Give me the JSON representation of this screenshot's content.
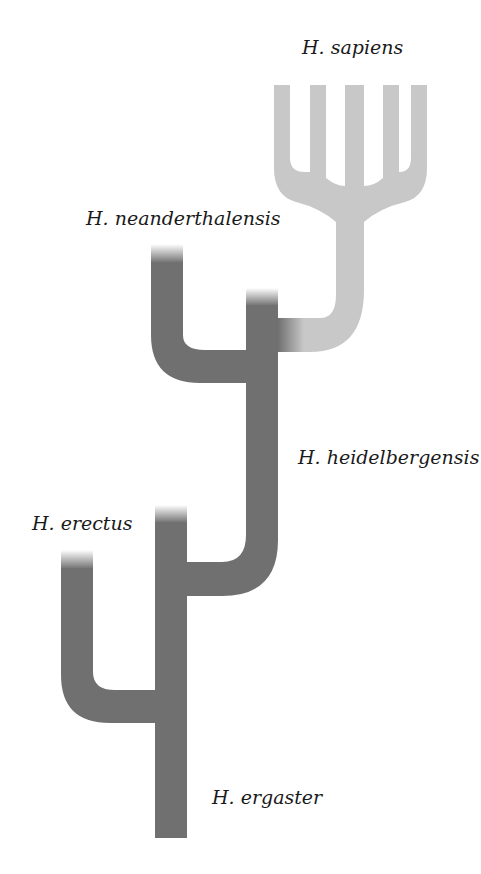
{
  "diagram": {
    "type": "phylogenetic-tree",
    "colors": {
      "dark_branch": "#707070",
      "light_branch": "#c8c8c8",
      "background": "#ffffff",
      "label_text": "#1a1a1a"
    },
    "labels": {
      "sapiens": "H. sapiens",
      "neanderthalensis": "H. neanderthalensis",
      "heidelbergensis": "H. heidelbergensis",
      "erectus": "H. erectus",
      "ergaster": "H. ergaster"
    },
    "nodes": [
      {
        "id": "ergaster",
        "label": "H. ergaster",
        "shade": "dark"
      },
      {
        "id": "erectus",
        "label": "H. erectus",
        "shade": "dark",
        "parent": "ergaster"
      },
      {
        "id": "heidelbergensis",
        "label": "H. heidelbergensis",
        "shade": "dark",
        "parent": "ergaster"
      },
      {
        "id": "neanderthalensis",
        "label": "H. neanderthalensis",
        "shade": "dark",
        "parent": "heidelbergensis"
      },
      {
        "id": "sapiens",
        "label": "H. sapiens",
        "shade": "light",
        "parent": "heidelbergensis",
        "branches": 5
      }
    ]
  }
}
